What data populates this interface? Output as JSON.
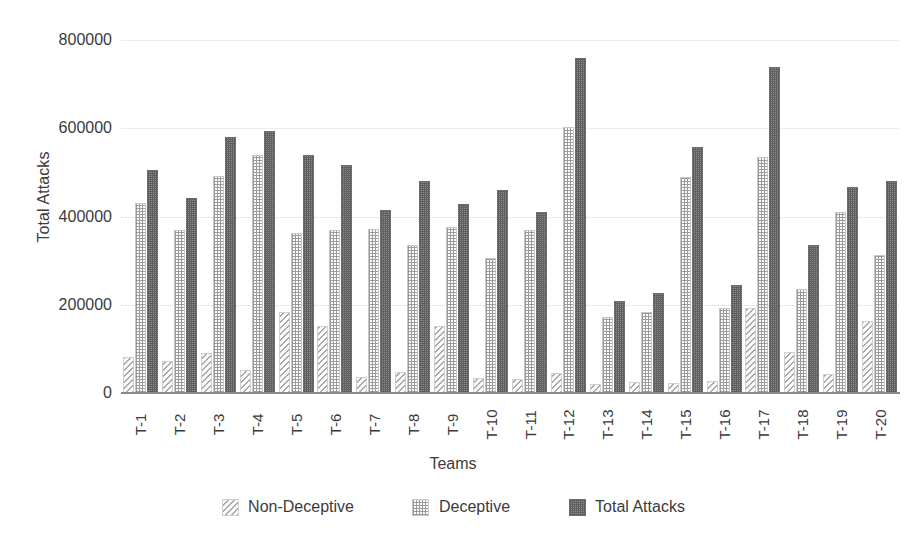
{
  "chart_data": {
    "type": "bar",
    "title": "",
    "xlabel": "Teams",
    "ylabel": "Total Attacks",
    "ylim": [
      0,
      800000
    ],
    "ytick_labels": [
      "0",
      "200000",
      "400000",
      "600000",
      "800000"
    ],
    "ytick_values": [
      0,
      200000,
      400000,
      600000,
      800000
    ],
    "grid": true,
    "legend_position": "bottom",
    "categories": [
      "T-1",
      "T-2",
      "T-3",
      "T-4",
      "T-5",
      "T-6",
      "T-7",
      "T-8",
      "T-9",
      "T-10",
      "T-11",
      "T-12",
      "T-13",
      "T-14",
      "T-15",
      "T-16",
      "T-17",
      "T-18",
      "T-19",
      "T-20"
    ],
    "series": [
      {
        "name": "Non-Deceptive",
        "pattern": "diagonal-hatch",
        "color": "#a8a8a8",
        "values": [
          78000,
          68000,
          87000,
          48000,
          178000,
          148000,
          32000,
          44000,
          147000,
          29000,
          28000,
          40000,
          16000,
          21000,
          18000,
          22000,
          188000,
          88000,
          38000,
          158000
        ]
      },
      {
        "name": "Deceptive",
        "pattern": "dotted-grid",
        "color": "#9a9a9a",
        "values": [
          425000,
          364000,
          487000,
          535000,
          357000,
          364000,
          368000,
          331000,
          371000,
          302000,
          366000,
          598000,
          167000,
          180000,
          486000,
          188000,
          531000,
          232000,
          406000,
          308000
        ]
      },
      {
        "name": "Total Attacks",
        "pattern": "dense-checker",
        "color": "#6d6d6d",
        "values": [
          502000,
          438000,
          575000,
          590000,
          535000,
          513000,
          410000,
          475000,
          424000,
          455000,
          406000,
          755000,
          205000,
          221000,
          553000,
          240000,
          734000,
          331000,
          463000,
          475000
        ]
      }
    ]
  }
}
